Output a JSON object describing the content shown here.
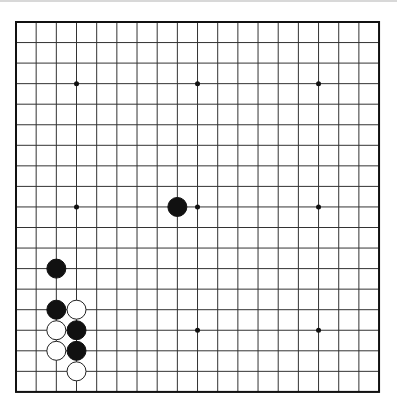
{
  "board": {
    "size": 19,
    "origin_x": 16,
    "origin_y": 22,
    "spacing_x": 20.17,
    "spacing_y": 20.55,
    "line_color": "#333333",
    "border_color": "#111111",
    "background": "#ffffff",
    "star_points": [
      [
        3,
        3
      ],
      [
        9,
        3
      ],
      [
        15,
        3
      ],
      [
        3,
        9
      ],
      [
        9,
        9
      ],
      [
        15,
        9
      ],
      [
        3,
        15
      ],
      [
        9,
        15
      ],
      [
        15,
        15
      ]
    ]
  },
  "stones": [
    {
      "color": "black",
      "col": 8,
      "row": 9
    },
    {
      "color": "black",
      "col": 2,
      "row": 12
    },
    {
      "color": "black",
      "col": 2,
      "row": 14
    },
    {
      "color": "white",
      "col": 3,
      "row": 14
    },
    {
      "color": "white",
      "col": 2,
      "row": 15
    },
    {
      "color": "black",
      "col": 3,
      "row": 15
    },
    {
      "color": "white",
      "col": 2,
      "row": 16
    },
    {
      "color": "black",
      "col": 3,
      "row": 16
    },
    {
      "color": "white",
      "col": 3,
      "row": 17
    }
  ],
  "colors": {
    "black_stone": "#111111",
    "white_stone": "#ffffff",
    "white_stone_outline": "#222222"
  }
}
